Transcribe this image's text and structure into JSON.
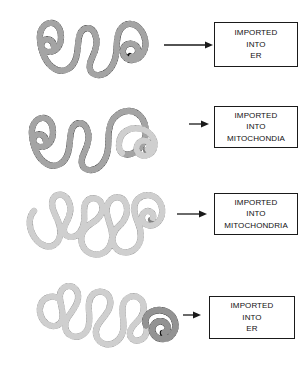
{
  "figure": {
    "background_color": "#ffffff",
    "colors": {
      "black_chain": "#111111",
      "gray_chain": "#808080",
      "box_border": "#1a1a1a",
      "arrow": "#1a1a1a",
      "text": "#111111"
    }
  },
  "rows": [
    {
      "id": "row-1",
      "chain": {
        "name": "beaded-chain-black",
        "description": "black beaded polypeptide chain with left spiral and right spiral",
        "segments": [
          {
            "color": "#111111",
            "portion": "entire chain"
          }
        ]
      },
      "arrow": {
        "name": "arrow-right",
        "length": 48
      },
      "destination": {
        "lines": [
          "IMPORTED",
          "INTO",
          "ER"
        ]
      }
    },
    {
      "id": "row-2",
      "chain": {
        "name": "beaded-chain-black-to-gray",
        "description": "beaded chain black on left, gray at right end including terminal spiral",
        "segments": [
          {
            "color": "#111111",
            "portion": "left and middle"
          },
          {
            "color": "#808080",
            "portion": "right end and terminal spiral"
          }
        ]
      },
      "arrow": {
        "name": "arrow-right",
        "length": 20
      },
      "destination": {
        "lines": [
          "IMPORTED",
          "INTO",
          "MITOCHONDIA"
        ]
      }
    },
    {
      "id": "row-3",
      "chain": {
        "name": "beaded-chain-gray",
        "description": "fully gray beaded polypeptide chain ending in right spiral",
        "segments": [
          {
            "color": "#808080",
            "portion": "entire chain"
          }
        ]
      },
      "arrow": {
        "name": "arrow-right",
        "length": 30
      },
      "destination": {
        "lines": [
          "IMPORTED",
          "INTO",
          "MITOCHONDRIA"
        ]
      }
    },
    {
      "id": "row-4",
      "chain": {
        "name": "beaded-chain-gray-to-black",
        "description": "beaded chain gray on left, black terminal spiral at right end",
        "segments": [
          {
            "color": "#808080",
            "portion": "left and middle"
          },
          {
            "color": "#111111",
            "portion": "right terminal spiral"
          }
        ]
      },
      "arrow": {
        "name": "arrow-right",
        "length": 18
      },
      "destination": {
        "lines": [
          "IMPORTED",
          "INTO",
          "ER"
        ]
      }
    }
  ]
}
